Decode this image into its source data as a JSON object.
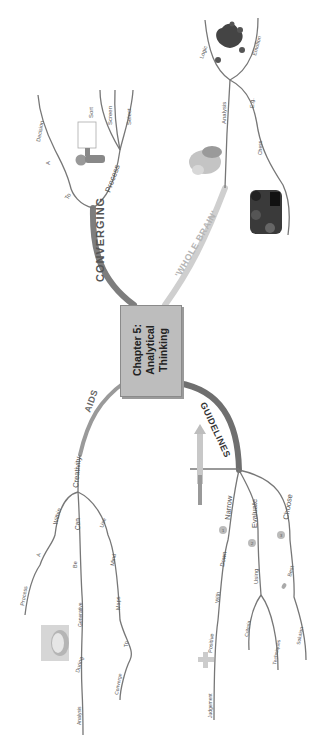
{
  "central_topic": {
    "line1": "Chapter 5:",
    "line2": "Analytical",
    "line3": "Thinking"
  },
  "branches": {
    "converging": {
      "label": "CONVERGING",
      "color": "#7d7d7d",
      "sub": {
        "to": "To",
        "a": "A",
        "decision": "Decision",
        "process": "Process",
        "sort": "Sort",
        "screen": "Screen",
        "select": "Select"
      }
    },
    "whole_brain": {
      "label": "'WHOLE BRAIN'",
      "color": "#c8c8c8",
      "sub": {
        "analysis": "Analysis",
        "logic": "Logic",
        "emotion": "Emotion",
        "e_g": "E.g.",
        "chess": "Chess"
      }
    },
    "aids": {
      "label": "AIDS",
      "color": "#9a9a9a",
      "sub": {
        "creativity": "Creativity",
        "within": "Within",
        "a": "A",
        "process": "Process",
        "can": "Can",
        "be": "Be",
        "generative": "Generative",
        "during": "During",
        "analysis": "Analysis",
        "use": "Use",
        "mind": "Mind",
        "maps": "Maps",
        "to": "To",
        "converge": "Converge"
      }
    },
    "guidelines": {
      "label": "GUIDELINES",
      "color": "#6f6f6f",
      "sub": {
        "narrow": "Narrow",
        "down": "Down",
        "with": "With",
        "positive": "Positive",
        "judgement": "Judgement",
        "evaluate": "Evaluate",
        "using": "Using",
        "criteria": "Criteria",
        "techniques": "Techniques",
        "choose": "Choose",
        "best": "Best",
        "solution": "Solution",
        "step1": "1",
        "step2": "2",
        "step3": "3"
      }
    }
  },
  "images": {
    "thinking_figure": "person-thinking-figure",
    "brain_pile": "cartoon-brain-figure",
    "heart_character": "heart-character",
    "chess_pieces": "chess-pieces",
    "face_photo": "face-photo",
    "arrow_up": "upward-arrow",
    "plus_sign": "plus-sign",
    "small_marker": "small-marker"
  }
}
